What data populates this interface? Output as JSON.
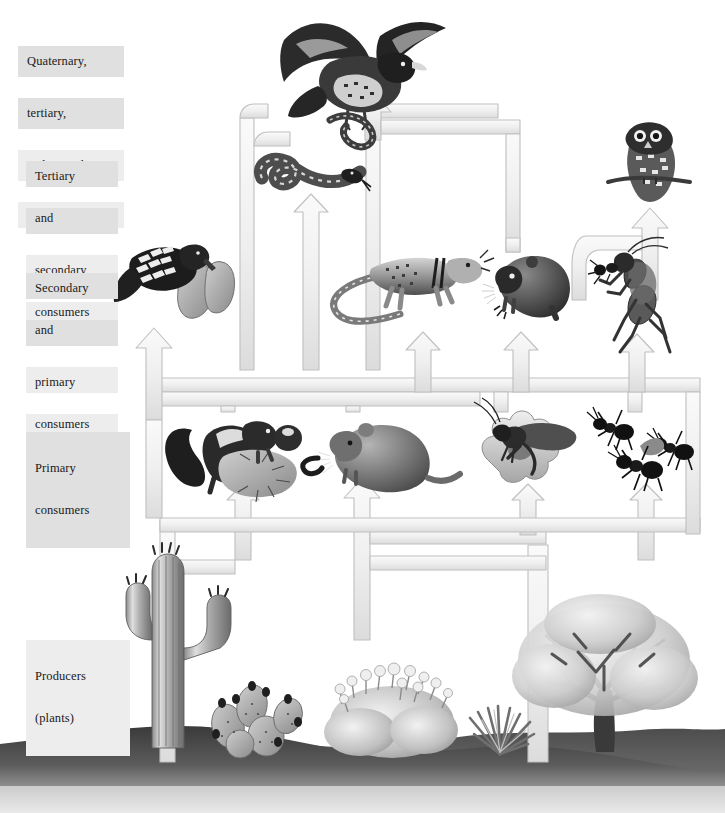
{
  "diagram": {
    "type": "food-web",
    "background_color": "#ffffff",
    "arrow_fill": "#f0f0f0",
    "arrow_stroke": "#b8b8b8",
    "label_background": "#e0e0e0",
    "label_background_light": "#ededed",
    "ground_color": "#4a4a4a"
  },
  "levels": [
    {
      "id": "quaternary",
      "label": "Quaternary,\ntertiary,\nand secondary\nconsumers",
      "line1": "Quaternary,",
      "line2": "tertiary,",
      "line3": "and secondary",
      "line4": "consumers",
      "x": 18,
      "y": 25,
      "width": 106
    },
    {
      "id": "tertiary",
      "label": "Tertiary\nand\n\nsecondary\nconsumers",
      "line1": "Tertiary",
      "line2": "and",
      "line3": "secondary",
      "line4": "consumers",
      "x": 26,
      "y": 140,
      "width": 92
    },
    {
      "id": "secondary",
      "label": "Secondary\nand\n\nprimary\nconsumers",
      "line1": "Secondary",
      "line2": "and",
      "line3": "primary",
      "line4": "consumers",
      "x": 26,
      "y": 252,
      "width": 92
    },
    {
      "id": "primary",
      "label": "Primary\nconsumers",
      "line1": "Primary",
      "line2": "consumers",
      "x": 26,
      "y": 432,
      "width": 86
    },
    {
      "id": "producers",
      "label": "Producers\n(plants)",
      "line1": "Producers",
      "line2": "(plants)",
      "x": 26,
      "y": 640,
      "width": 86
    }
  ],
  "organisms": [
    {
      "id": "hawk",
      "name": "hawk-with-snake",
      "common_name": "Hawk",
      "level": "quaternary",
      "x": 285,
      "y": 12,
      "width": 170,
      "height": 125
    },
    {
      "id": "rattlesnake",
      "name": "rattlesnake",
      "common_name": "Rattlesnake",
      "level": "tertiary",
      "x": 250,
      "y": 145,
      "width": 115,
      "height": 62
    },
    {
      "id": "owl",
      "name": "owl-on-branch",
      "common_name": "Owl",
      "level": "tertiary",
      "x": 605,
      "y": 118,
      "width": 92,
      "height": 98
    },
    {
      "id": "woodpecker",
      "name": "woodpecker-on-cactus",
      "common_name": "Gila woodpecker",
      "level": "secondary",
      "x": 128,
      "y": 236,
      "width": 112,
      "height": 98
    },
    {
      "id": "lizard",
      "name": "collared-lizard",
      "common_name": "Lizard",
      "level": "secondary",
      "x": 330,
      "y": 248,
      "width": 160,
      "height": 88
    },
    {
      "id": "mouse",
      "name": "pocket-mouse",
      "common_name": "Mouse",
      "level": "secondary",
      "x": 487,
      "y": 252,
      "width": 92,
      "height": 78
    },
    {
      "id": "mantis",
      "name": "mantis-eating-ant",
      "common_name": "Mantis",
      "level": "secondary",
      "x": 590,
      "y": 240,
      "width": 108,
      "height": 122
    },
    {
      "id": "squirrel",
      "name": "squirrel-with-fruit",
      "common_name": "Antelope squirrel",
      "level": "primary",
      "x": 165,
      "y": 415,
      "width": 128,
      "height": 92
    },
    {
      "id": "packrat",
      "name": "pack-rat",
      "common_name": "Pack rat",
      "level": "primary",
      "x": 315,
      "y": 420,
      "width": 135,
      "height": 72
    },
    {
      "id": "grasshopper",
      "name": "grasshopper-on-flower",
      "common_name": "Grasshopper",
      "level": "primary",
      "x": 478,
      "y": 412,
      "width": 125,
      "height": 85
    },
    {
      "id": "ants",
      "name": "harvester-ants",
      "common_name": "Ants",
      "level": "primary",
      "x": 598,
      "y": 418,
      "width": 110,
      "height": 72
    },
    {
      "id": "saguaro",
      "name": "saguaro-cactus",
      "common_name": "Saguaro cactus",
      "level": "producers",
      "x": 128,
      "y": 548,
      "width": 78,
      "height": 200
    },
    {
      "id": "pricklypear",
      "name": "prickly-pear-cactus",
      "common_name": "Prickly pear",
      "level": "producers",
      "x": 205,
      "y": 672,
      "width": 110,
      "height": 78
    },
    {
      "id": "shrub",
      "name": "flowering-shrub",
      "common_name": "Flowering shrub",
      "level": "producers",
      "x": 325,
      "y": 660,
      "width": 130,
      "height": 98
    },
    {
      "id": "agave",
      "name": "agave-plant",
      "common_name": "Agave",
      "level": "producers",
      "x": 470,
      "y": 712,
      "width": 62,
      "height": 48
    },
    {
      "id": "tree",
      "name": "desert-tree",
      "common_name": "Desert tree",
      "level": "producers",
      "x": 510,
      "y": 598,
      "width": 175,
      "height": 162
    }
  ],
  "energy_flows": [
    {
      "id": "f1",
      "from": "saguaro",
      "to": "woodpecker"
    },
    {
      "id": "f2",
      "from": "saguaro",
      "to": "squirrel"
    },
    {
      "id": "f3",
      "from": "pricklypear",
      "to": "squirrel"
    },
    {
      "id": "f4",
      "from": "shrub",
      "to": "packrat"
    },
    {
      "id": "f5",
      "from": "shrub",
      "to": "grasshopper"
    },
    {
      "id": "f6",
      "from": "tree",
      "to": "grasshopper"
    },
    {
      "id": "f7",
      "from": "tree",
      "to": "ants"
    },
    {
      "id": "f8",
      "from": "squirrel",
      "to": "woodpecker"
    },
    {
      "id": "f9",
      "from": "squirrel",
      "to": "rattlesnake"
    },
    {
      "id": "f10",
      "from": "packrat",
      "to": "lizard"
    },
    {
      "id": "f11",
      "from": "packrat",
      "to": "rattlesnake"
    },
    {
      "id": "f12",
      "from": "grasshopper",
      "to": "lizard"
    },
    {
      "id": "f13",
      "from": "grasshopper",
      "to": "mouse"
    },
    {
      "id": "f14",
      "from": "ants",
      "to": "mantis"
    },
    {
      "id": "f15",
      "from": "mouse",
      "to": "owl"
    },
    {
      "id": "f16",
      "from": "mantis",
      "to": "owl"
    },
    {
      "id": "f17",
      "from": "lizard",
      "to": "rattlesnake"
    },
    {
      "id": "f18",
      "from": "rattlesnake",
      "to": "hawk"
    },
    {
      "id": "f19",
      "from": "mouse",
      "to": "hawk"
    },
    {
      "id": "f20",
      "from": "woodpecker",
      "to": "hawk"
    }
  ]
}
